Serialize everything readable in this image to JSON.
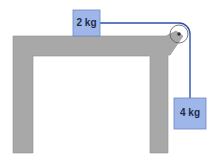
{
  "diagram": {
    "type": "physics-pulley-system",
    "blocks": [
      {
        "id": "block-on-table",
        "label": "2 kg",
        "mass_kg": 2
      },
      {
        "id": "hanging-block",
        "label": "4 kg",
        "mass_kg": 4
      }
    ],
    "colors": {
      "table": "#a8a8a8",
      "table_edge": "#8a8a8a",
      "block_fill": "#9fb6e8",
      "block_edge": "#6f86c8",
      "rope": "#2d4fb3"
    }
  }
}
